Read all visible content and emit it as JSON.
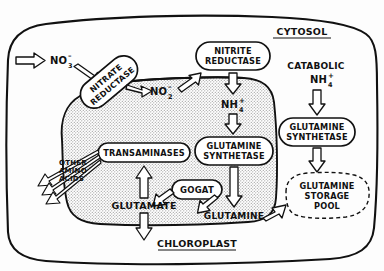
{
  "diagram": {
    "title_compartments": {
      "cytosol": "CYTOSOL",
      "chloroplast": "CHLOROPLAST"
    },
    "metabolites": {
      "nitrate_external": "NO",
      "nitrate_sub": "3",
      "nitrate_sup": "–",
      "nitrite": "NO",
      "nitrite_sub": "2",
      "nitrite_sup": "–",
      "ammonium": "NH",
      "ammonium_sub": "4",
      "ammonium_sup": "+",
      "catabolic_line1": "CATABOLIC",
      "catabolic_line2": "NH",
      "catabolic_sub": "4",
      "catabolic_sup": "+",
      "glutamate": "GLUTAMATE",
      "glutamine_chloroplast": "GLUTAMINE",
      "other_amino_l1": "OTHER",
      "other_amino_l2": "AMINO",
      "other_amino_l3": "ACIDS"
    },
    "enzymes": {
      "nitrate_reductase_l1": "NITRATE",
      "nitrate_reductase_l2": "REDUCTASE",
      "nitrite_reductase_l1": "NITRITE",
      "nitrite_reductase_l2": "REDUCTASE",
      "glutamine_synthetase_chloro_l1": "GLUTAMINE",
      "glutamine_synthetase_chloro_l2": "SYNTHETASE",
      "glutamine_synthetase_cyto_l1": "GLUTAMINE",
      "glutamine_synthetase_cyto_l2": "SYNTHETASE",
      "transaminases": "TRANSAMINASES",
      "gogat": "GOGAT"
    },
    "pools": {
      "storage_l1": "GLUTAMINE",
      "storage_l2": "STORAGE",
      "storage_l3": "POOL"
    },
    "colors": {
      "ink": "#111111",
      "paper": "#fdfdfd",
      "chloroplast_fill": "#d8d8d8",
      "arrow_fill": "#ffffff"
    }
  }
}
